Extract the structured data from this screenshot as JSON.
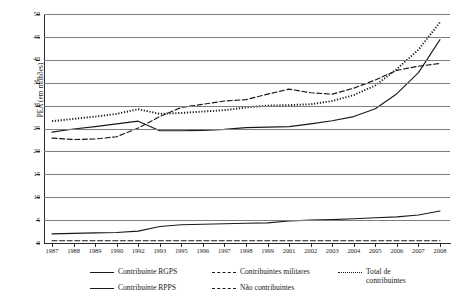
{
  "chart_data": {
    "type": "line",
    "title": "",
    "xlabel": "",
    "ylabel": "PEA (em milhões)",
    "ylim": [
      0,
      50
    ],
    "ytick_step": 5,
    "grid": true,
    "legend_position": "bottom",
    "x": [
      1987,
      1988,
      1989,
      1990,
      1992,
      1993,
      1995,
      1996,
      1997,
      1998,
      1999,
      2001,
      2002,
      2003,
      2004,
      2005,
      2006,
      2007,
      2008
    ],
    "ytick_labels": [
      "0",
      "5",
      "10",
      "15",
      "20",
      "25",
      "30",
      "35",
      "40",
      "45",
      "50"
    ],
    "xtick_labels": [
      "1987",
      "1988",
      "1989",
      "1990",
      "1992",
      "1993",
      "1995",
      "1996",
      "1997",
      "1998",
      "1999",
      "2001",
      "2002",
      "2003",
      "2004",
      "2005",
      "2006",
      "2007",
      "2008"
    ],
    "series": [
      {
        "name": "Contribuinte RGPS",
        "style": "solid",
        "color": "#1a1a1a",
        "values": [
          24.2,
          24.9,
          25.4,
          26.0,
          26.6,
          24.5,
          24.5,
          24.6,
          24.8,
          25.2,
          25.3,
          25.4,
          26.0,
          26.7,
          27.6,
          29.3,
          32.6,
          37.2,
          44.4
        ]
      },
      {
        "name": "Contribuinte RPPS",
        "style": "solid",
        "color": "#1a1a1a",
        "values": [
          2.0,
          2.1,
          2.2,
          2.3,
          2.6,
          3.6,
          4.0,
          4.1,
          4.2,
          4.3,
          4.4,
          4.8,
          5.0,
          5.1,
          5.3,
          5.5,
          5.7,
          6.1,
          7.0
        ]
      },
      {
        "name": "Contribuintes militares",
        "style": "dashed",
        "color": "#1a1a1a",
        "values": [
          0.5,
          0.5,
          0.5,
          0.5,
          0.5,
          0.5,
          0.5,
          0.5,
          0.5,
          0.5,
          0.5,
          0.5,
          0.5,
          0.5,
          0.5,
          0.5,
          0.5,
          0.5,
          0.5
        ]
      },
      {
        "name": "Não contribuintes",
        "style": "dashed",
        "color": "#1a1a1a",
        "values": [
          22.9,
          22.6,
          22.7,
          23.2,
          25.1,
          27.6,
          29.6,
          30.3,
          31.0,
          31.3,
          32.5,
          33.6,
          32.8,
          32.5,
          33.8,
          35.6,
          37.7,
          38.6,
          39.2
        ]
      },
      {
        "name": "Total de contribuintes",
        "style": "dotted",
        "color": "#1a1a1a",
        "values": [
          26.6,
          27.1,
          27.6,
          28.2,
          29.2,
          28.2,
          28.4,
          28.7,
          29.0,
          29.6,
          30.0,
          30.1,
          30.3,
          31.0,
          32.3,
          34.4,
          38.0,
          42.2,
          48.2
        ]
      }
    ]
  },
  "legend": {
    "items": [
      {
        "label": "Contribuinte RGPS",
        "style": "solid",
        "col": 0,
        "row": 0
      },
      {
        "label": "Contribuinte RPPS",
        "style": "solid",
        "col": 0,
        "row": 1
      },
      {
        "label": "Contribuintes militares",
        "style": "dashed",
        "col": 1,
        "row": 0
      },
      {
        "label": "Não contribuintes",
        "style": "dashed",
        "col": 1,
        "row": 1
      },
      {
        "label": "Total de",
        "label2": "contribuintes",
        "style": "dotted",
        "col": 2,
        "row": 0
      }
    ]
  }
}
